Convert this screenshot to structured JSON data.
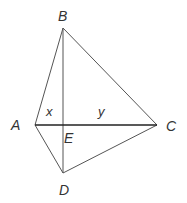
{
  "diagram": {
    "type": "geometry-figure",
    "vertices": {
      "A": {
        "label": "A",
        "x": 35,
        "y": 125
      },
      "B": {
        "label": "B",
        "x": 63,
        "y": 28
      },
      "C": {
        "label": "C",
        "x": 157,
        "y": 125
      },
      "D": {
        "label": "D",
        "x": 63,
        "y": 173
      },
      "E": {
        "label": "E",
        "x": 63,
        "y": 125
      }
    },
    "segments": [
      {
        "from": "A",
        "to": "B"
      },
      {
        "from": "B",
        "to": "C"
      },
      {
        "from": "A",
        "to": "C",
        "emphasis": true
      },
      {
        "from": "A",
        "to": "D"
      },
      {
        "from": "D",
        "to": "C"
      },
      {
        "from": "B",
        "to": "D"
      }
    ],
    "variables": {
      "x": {
        "label": "x",
        "segment": "AE"
      },
      "y": {
        "label": "y",
        "segment": "EC"
      }
    },
    "colors": {
      "line": "#555555",
      "emphasis_line": "#222222",
      "text": "#333333"
    }
  }
}
